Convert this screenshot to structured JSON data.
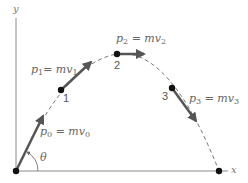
{
  "diagram": {
    "axes": {
      "x_label": "x",
      "y_label": "y",
      "angle_label": "θ"
    },
    "points": [
      {
        "id": "0",
        "label": "",
        "momentum": {
          "p": "p",
          "p_sub": "0",
          "eq": " = m",
          "v": "v",
          "v_sub": "0"
        }
      },
      {
        "id": "1",
        "label": "1",
        "momentum": {
          "p": "p",
          "p_sub": "1",
          "eq": "= m",
          "v": "v",
          "v_sub": "1"
        }
      },
      {
        "id": "2",
        "label": "2",
        "momentum": {
          "p": "p",
          "p_sub": "2",
          "eq": " = m",
          "v": "v",
          "v_sub": "2"
        }
      },
      {
        "id": "3",
        "label": "3",
        "momentum": {
          "p": "p",
          "p_sub": "3",
          "eq": " = m",
          "v": "v",
          "v_sub": "3"
        }
      }
    ],
    "colors": {
      "axis": "#8a8a8a",
      "trajectory": "#7a7a7a",
      "arrow": "#555555",
      "dot": "#111111",
      "text": "#666666"
    }
  }
}
